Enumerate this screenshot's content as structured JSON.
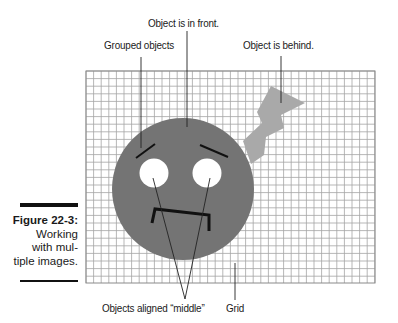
{
  "figure": {
    "number_label": "Figure 22-3:",
    "caption_lines": [
      "Working",
      "with mul-",
      "tiple images."
    ]
  },
  "callouts": {
    "front": "Object is in front.",
    "grouped": "Grouped objects",
    "behind": "Object is behind.",
    "aligned": "Objects aligned “middle”",
    "grid": "Grid"
  },
  "colors": {
    "grid_line": "#a4a4a4",
    "face": "#747474",
    "bolt": "#a9a9a9",
    "eye": "#ffffff",
    "ink": "#111111"
  },
  "grid": {
    "x": 86,
    "y": 71,
    "width": 289,
    "height": 212,
    "cell": 7.6
  }
}
